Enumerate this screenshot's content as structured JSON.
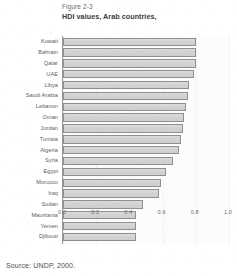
{
  "figure": {
    "number": "Figure 2-3",
    "title": "HDI values, Arab countries,",
    "source": "Source:  UNDP, 2000."
  },
  "chart_data": {
    "type": "bar",
    "orientation": "horizontal",
    "title": "HDI values, Arab countries,",
    "xlabel": "",
    "ylabel": "",
    "xlim": [
      0.0,
      1.0
    ],
    "xticks": [
      "0.0",
      "0.2",
      "0.4",
      "0.6",
      "0.8",
      "1.0"
    ],
    "grid": false,
    "legend": "none",
    "bar_color": "#d4d4d4",
    "bar_edge_color": "#8f8f8f",
    "categories": [
      "Kuwait",
      "Bahrain",
      "Qatar",
      "UAE",
      "Libya",
      "Saudi Arabia",
      "Lebanon",
      "Oman",
      "Jordan",
      "Tunisia",
      "Algeria",
      "Syria",
      "Egypt",
      "Morocco",
      "Iraq",
      "Sudan",
      "Mauritania",
      "Yemen",
      "Djibouti"
    ],
    "values": [
      0.8,
      0.8,
      0.8,
      0.79,
      0.76,
      0.75,
      0.74,
      0.73,
      0.72,
      0.71,
      0.7,
      0.66,
      0.62,
      0.59,
      0.58,
      0.48,
      0.44,
      0.44,
      0.44
    ]
  }
}
